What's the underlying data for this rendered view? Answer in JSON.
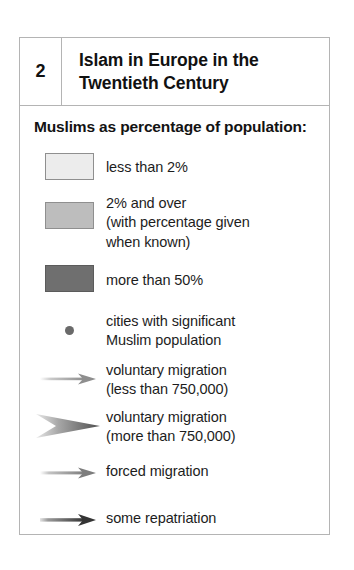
{
  "legend": {
    "header": {
      "number": "2",
      "title": "Islam in Europe in the Twentieth Century"
    },
    "subtitle": "Muslims as percentage of population:",
    "items": [
      {
        "symbol": "swatch-light",
        "label": "less than 2%",
        "color": "#ececec"
      },
      {
        "symbol": "swatch-mid",
        "label": "2% and over\n(with percentage given\nwhen known)",
        "color": "#bdbdbd"
      },
      {
        "symbol": "swatch-dark",
        "label": "more than 50%",
        "color": "#6f6f6f"
      },
      {
        "symbol": "city-dot",
        "label": "cities with significant\nMuslim population",
        "color": "#6a6a6a"
      },
      {
        "symbol": "arrow-thin",
        "label": "voluntary migration\n(less than 750,000)",
        "color": "#9a9a9a"
      },
      {
        "symbol": "arrow-thick",
        "label": "voluntary migration\n(more than 750,000)",
        "color": "#5a5a5a"
      },
      {
        "symbol": "arrow-forced",
        "label": "forced migration",
        "color": "#8a8a8a"
      },
      {
        "symbol": "arrow-repatriation",
        "label": "some repatriation",
        "color": "#3d3d3d"
      }
    ]
  },
  "colors": {
    "frame_border": "#b4b4b4",
    "text": "#1b1b1b",
    "background": "#ffffff"
  }
}
